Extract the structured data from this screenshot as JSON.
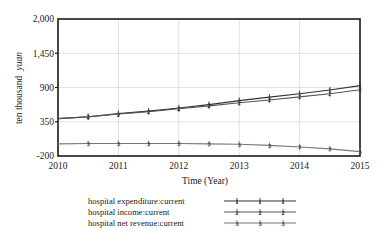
{
  "chart_data": {
    "type": "line",
    "title": "",
    "xlabel": "Time (Year)",
    "ylabel": "ten thousand yuan",
    "ylabel_plain": "ten thousand",
    "ylabel_italic": "yuan",
    "x": [
      2010,
      2010.5,
      2011,
      2011.5,
      2012,
      2012.5,
      2013,
      2013.5,
      2014,
      2014.5,
      2015
    ],
    "xlim": [
      2010,
      2015
    ],
    "ylim": [
      -200,
      2000
    ],
    "xticks": [
      "2010",
      "2011",
      "2012",
      "2013",
      "2014",
      "2015"
    ],
    "xtick_values": [
      2010,
      2011,
      2012,
      2013,
      2014,
      2015
    ],
    "yticks": [
      "-200",
      "350",
      "900",
      "1,450",
      "2,000"
    ],
    "ytick_values": [
      -200,
      350,
      900,
      1450,
      2000
    ],
    "grid": true,
    "grid_color": "#d9d9d9",
    "legend_position": "bottom",
    "series": [
      {
        "name": "hospital expenditure:current",
        "marker": "1",
        "color": "#333333",
        "values": [
          400,
          430,
          480,
          520,
          570,
          625,
          690,
          745,
          800,
          860,
          930
        ]
      },
      {
        "name": "hospital income:current",
        "marker": "2",
        "color": "#555555",
        "values": [
          400,
          428,
          474,
          512,
          558,
          605,
          655,
          700,
          750,
          800,
          865
        ]
      },
      {
        "name": "hospital net revenue:current",
        "marker": "3",
        "color": "#777777",
        "values": [
          -5,
          0,
          0,
          0,
          0,
          -5,
          -12,
          -30,
          -55,
          -85,
          -130
        ]
      }
    ]
  },
  "legend": {
    "items": [
      {
        "label": "hospital expenditure:current",
        "marker": "1"
      },
      {
        "label": "hospital income:current",
        "marker": "2"
      },
      {
        "label": "hospital net revenue:current",
        "marker": "3"
      }
    ]
  }
}
